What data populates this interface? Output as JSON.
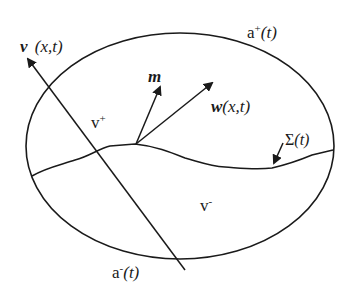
{
  "diagram": {
    "colors": {
      "stroke": "#1a1a1a",
      "background": "#ffffff"
    },
    "labels": {
      "velocity_v_symbol": "v",
      "velocity_v_args": "(x,t)",
      "region_plus_base": "v",
      "region_plus_sup": "+",
      "region_minus_base": "v",
      "region_minus_sup": "-",
      "boundary_plus_base": "a",
      "boundary_plus_sup": "+",
      "boundary_plus_args": "(t)",
      "boundary_minus_base": "a",
      "boundary_minus_sup": "-",
      "boundary_minus_args": "(t)",
      "normal_m": "m",
      "interface_velocity_symbol": "w",
      "interface_velocity_args": "(x,t)",
      "interface_symbol": "Σ",
      "interface_args": "(t)"
    }
  }
}
